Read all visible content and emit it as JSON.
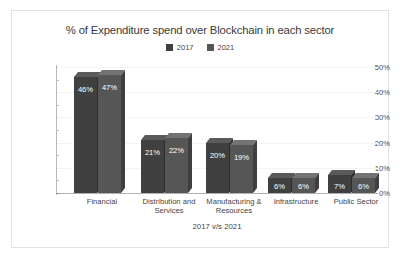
{
  "card": {
    "border_color": "#e2e2e2",
    "background": "#ffffff"
  },
  "chart_data": {
    "type": "bar",
    "title": "% of Expenditure spend over Blockchain in each sector",
    "xlabel": "2017 v/s 2021",
    "ylabel": "",
    "ylim": [
      0,
      50
    ],
    "ytick_labels": [
      "0%",
      "10%",
      "20%",
      "30%",
      "40%",
      "50%"
    ],
    "ytick_values": [
      0,
      10,
      20,
      30,
      40,
      50
    ],
    "minor_tick_step": 5,
    "grid": true,
    "legend_position": "top-center",
    "categories": [
      "Financial",
      "Distribution and Services",
      "Manufacturing & Resources",
      "Infrastructure",
      "Public Sector"
    ],
    "series": [
      {
        "name": "2017",
        "color": "#404040",
        "color_top": "#5a5a5a",
        "color_side": "#2e2e2e",
        "values": [
          46,
          21,
          20,
          6,
          7
        ],
        "labels": [
          "46%",
          "21%",
          "20%",
          "6%",
          "7%"
        ]
      },
      {
        "name": "2021",
        "color": "#565656",
        "color_top": "#737373",
        "color_side": "#3f3f3f",
        "values": [
          47,
          22,
          19,
          6,
          6
        ],
        "labels": [
          "47%",
          "22%",
          "19%",
          "6%",
          "6%"
        ]
      }
    ]
  }
}
